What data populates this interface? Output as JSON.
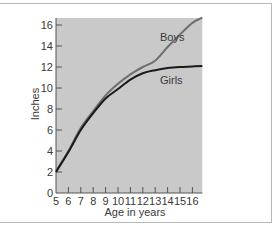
{
  "chart_data": {
    "type": "line",
    "title": "",
    "xlabel": "Age in years",
    "ylabel": "Inches",
    "xlim": [
      5,
      16.8
    ],
    "ylim": [
      0,
      17
    ],
    "x_ticks": [
      5,
      6,
      7,
      8,
      9,
      10,
      11,
      12,
      13,
      14,
      15,
      16
    ],
    "y_ticks": [
      0,
      2,
      4,
      6,
      8,
      10,
      12,
      14,
      16
    ],
    "grid": false,
    "legend": "inline labels",
    "series": [
      {
        "name": "Boys",
        "color": "#6e6e6e",
        "x": [
          5,
          6,
          7,
          8,
          9,
          10,
          11,
          12,
          13,
          14,
          15,
          16,
          16.8
        ],
        "values": [
          2.1,
          4.0,
          6.2,
          7.8,
          9.3,
          10.4,
          11.3,
          12.0,
          12.6,
          13.9,
          15.1,
          16.2,
          16.7
        ]
      },
      {
        "name": "Girls",
        "color": "#1a1a1a",
        "x": [
          5,
          6,
          7,
          8,
          9,
          10,
          11,
          12,
          13,
          14,
          15,
          16,
          16.8
        ],
        "values": [
          2.0,
          3.9,
          6.0,
          7.6,
          9.0,
          9.9,
          10.8,
          11.4,
          11.7,
          11.9,
          12.0,
          12.05,
          12.1
        ]
      }
    ]
  },
  "labels": {
    "boys": "Boys",
    "girls": "Girls",
    "xlabel": "Age in years",
    "ylabel": "Inches"
  },
  "colors": {
    "plot_background": "#c9c9c9",
    "axis": "#555555"
  }
}
